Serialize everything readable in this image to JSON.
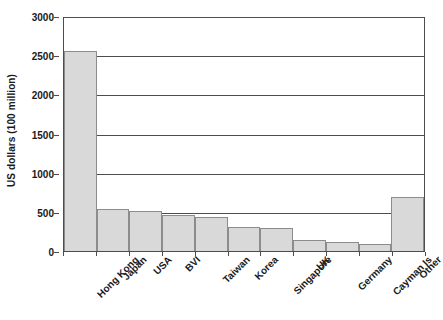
{
  "chart_data": {
    "type": "bar",
    "title": "",
    "subtitle": "",
    "xlabel": "",
    "ylabel": "US dollars (100 million)",
    "ylim": [
      0,
      3000
    ],
    "yticks": [
      0,
      500,
      1000,
      1500,
      2000,
      2500,
      3000
    ],
    "ytick_labels": [
      "0",
      "500",
      "1000",
      "1500",
      "2000",
      "2500",
      "3000"
    ],
    "grid": true,
    "legend": false,
    "legend_position": "none",
    "categories": [
      "Hong Kong",
      "Japan",
      "USA",
      "BVI",
      "Taiwan",
      "Korea",
      "Singapore",
      "UK",
      "Germany",
      "Cayman Is",
      "Other"
    ],
    "values": [
      2550,
      540,
      515,
      465,
      430,
      310,
      290,
      135,
      115,
      85,
      690
    ],
    "series": [
      {
        "name": "US dollars (100 million)",
        "values": [
          2550,
          540,
          515,
          465,
          430,
          310,
          290,
          135,
          115,
          85,
          690
        ]
      }
    ],
    "colors": {
      "bar_fill": "#d9d9d9",
      "bar_border": "#8c8c8c",
      "axis": "#4d4d4d",
      "text": "#1a1a1a",
      "background": "#ffffff"
    }
  }
}
